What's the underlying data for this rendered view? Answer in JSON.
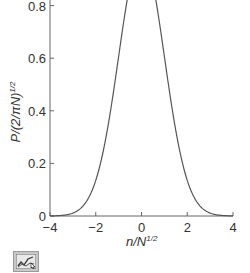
{
  "chart_data": {
    "type": "line",
    "title": "",
    "xlabel": "n/N^1/2",
    "ylabel": "P/(2/πN)^1/2",
    "xlim": [
      -4,
      4
    ],
    "ylim": [
      0,
      0.82
    ],
    "x_ticks": [
      -4,
      -2,
      0,
      2,
      4
    ],
    "x_tick_labels": [
      "−4",
      "−2",
      "0",
      "2",
      "4"
    ],
    "y_ticks": [
      0,
      0.2,
      0.4,
      0.6,
      0.8
    ],
    "y_tick_labels": [
      "0",
      "0.2",
      "0.4",
      "0.6",
      "0.8"
    ],
    "grid": false,
    "legend": null,
    "series": [
      {
        "name": "Gaussian distribution",
        "x": [
          -4,
          -3.5,
          -3,
          -2.5,
          -2,
          -1.5,
          -1,
          -0.5,
          0,
          0.5,
          1,
          1.5,
          2,
          2.5,
          3,
          3.5,
          4
        ],
        "values": [
          0.0003,
          0.0022,
          0.011,
          0.044,
          0.135,
          0.325,
          0.607,
          0.882,
          1.0,
          0.882,
          0.607,
          0.325,
          0.135,
          0.044,
          0.011,
          0.0022,
          0.0003
        ]
      }
    ]
  },
  "labels": {
    "x_axis_main": "n/N",
    "x_axis_sup": "1/2",
    "y_axis_main": "P/(2/πN)",
    "y_axis_sup": "1/2"
  },
  "toolbar": {
    "chart_icon": "line-chart-icon"
  }
}
